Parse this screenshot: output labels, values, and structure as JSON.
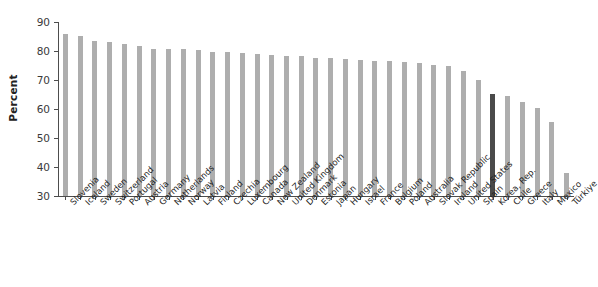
{
  "chart_data": {
    "type": "bar",
    "title": "",
    "xlabel": "",
    "ylabel": "Percent",
    "ylim": [
      30,
      90
    ],
    "yticks": [
      30,
      40,
      50,
      60,
      70,
      80,
      90
    ],
    "grid": false,
    "legend": "none",
    "bar_color": "#aeaeae",
    "highlight_color": "#4a4a4a",
    "highlight_category": "Korea, Rep.",
    "categories": [
      "Slovenia",
      "Iceland",
      "Sweden",
      "Switzerland",
      "Portugal",
      "Austria",
      "Germany",
      "Netherlands",
      "Norway",
      "Latvia",
      "Finland",
      "Czechia",
      "Luxembourg",
      "Canada",
      "New Zealand",
      "United Kingdom",
      "Denmark",
      "Estonia",
      "Japan",
      "Hungary",
      "Israel",
      "France",
      "Belgium",
      "Poland",
      "Australia",
      "Slovak Republic",
      "Ireland",
      "United States",
      "Spain",
      "Korea, Rep.",
      "Chile",
      "Greece",
      "Italy",
      "Mexico",
      "Türkiye"
    ],
    "values": [
      86.0,
      85.3,
      83.5,
      83.0,
      82.3,
      81.7,
      80.8,
      80.8,
      80.7,
      80.5,
      79.8,
      79.5,
      79.2,
      78.8,
      78.5,
      78.3,
      78.2,
      77.7,
      77.5,
      77.3,
      76.8,
      76.7,
      76.5,
      76.2,
      75.8,
      75.3,
      74.8,
      73.0,
      70.0,
      65.2,
      64.5,
      62.5,
      60.5,
      55.5,
      38.0
    ]
  }
}
